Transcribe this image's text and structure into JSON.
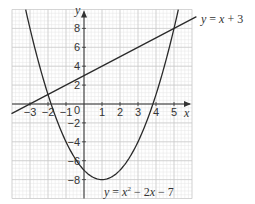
{
  "chart_data": {
    "type": "line",
    "title": "",
    "xlabel": "x",
    "ylabel": "y",
    "xlim": [
      -4,
      6
    ],
    "ylim": [
      -10,
      10
    ],
    "grid": true,
    "x_ticks": [
      -3,
      -2,
      -1,
      1,
      2,
      3,
      4,
      5
    ],
    "x_tick_labels": [
      "−3",
      "−2",
      "−1",
      "1",
      "2",
      "3",
      "4",
      "5"
    ],
    "y_ticks": [
      8,
      6,
      4,
      2,
      -2,
      -4,
      -6,
      -8
    ],
    "y_tick_labels": [
      "8",
      "6",
      "4",
      "2",
      "−2",
      "−4",
      "−6",
      "−8"
    ],
    "origin_label": "0",
    "series": [
      {
        "name": "y = x + 3",
        "kind": "linear",
        "equation": "y = x + 3",
        "x": [
          -4,
          6
        ],
        "y": [
          -1,
          9
        ]
      },
      {
        "name": "y = x² − 2x − 7",
        "kind": "quadratic",
        "equation": "y = x^2 - 2x - 7",
        "vertex": [
          1,
          -8
        ],
        "x_intercepts": [
          -1.83,
          3.83
        ],
        "x": [
          -3.2,
          -3,
          -2,
          -1,
          0,
          1,
          2,
          3,
          4,
          5,
          5.2
        ],
        "y": [
          9.64,
          8,
          1,
          -4,
          -7,
          -8,
          -7,
          -4,
          1,
          8,
          9.64
        ]
      }
    ],
    "intersections": [
      [
        -2,
        1
      ],
      [
        5,
        8
      ]
    ],
    "annotations": [
      {
        "text": "y = x + 3",
        "near": "top-right of line"
      },
      {
        "text": "y = x² − 2x − 7",
        "near": "bottom of parabola"
      }
    ]
  },
  "labels": {
    "x_axis": "x",
    "y_axis": "y",
    "origin": "0",
    "line_eq": {
      "y": "y",
      "eq": " = ",
      "x": "x",
      "rest": " + 3"
    },
    "parab_eq": {
      "y": "y",
      "eq": " = ",
      "x1": "x",
      "sup": "2",
      "mid": " − 2",
      "x2": "x",
      "rest": " − 7"
    }
  },
  "colors": {
    "curve": "#2a2a2a",
    "axis": "#333333",
    "grid_major": "#c8c8c8",
    "grid_minor": "#e4e4e4",
    "background": "#ffffff"
  }
}
